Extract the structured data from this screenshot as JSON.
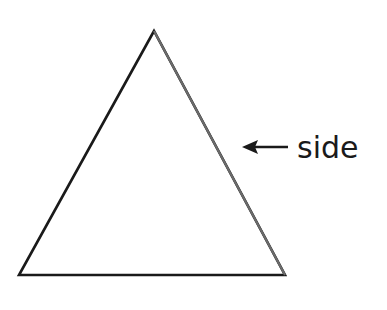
{
  "diagram": {
    "shape": "triangle",
    "label": "side",
    "stroke_color": "#1a1a1a",
    "arrow_direction": "left"
  }
}
